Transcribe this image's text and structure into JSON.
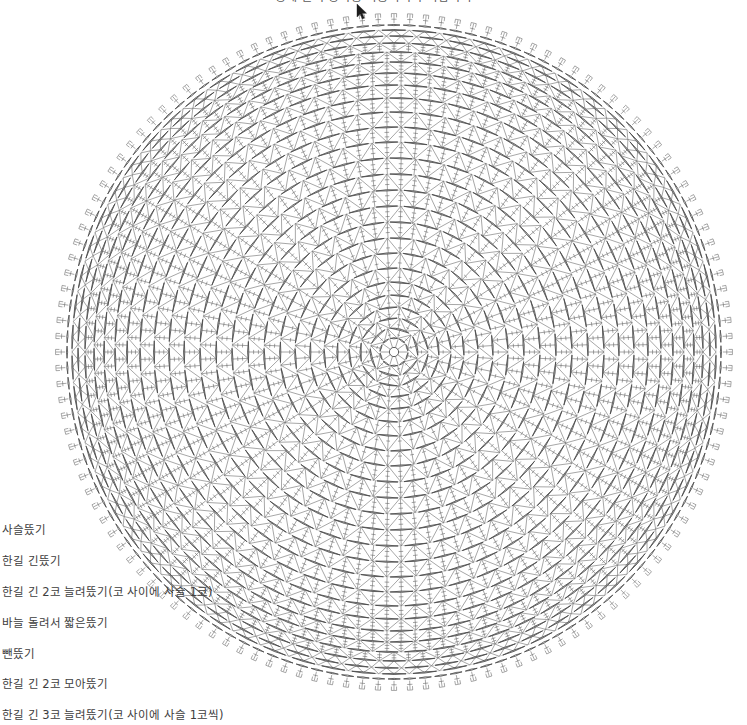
{
  "document": {
    "kind": "crochet-chart",
    "title_partial": "장에 길이 장식용 사용하시기 바랍니다",
    "background_color": "#ffffff",
    "ink_color": "#6b6b6b",
    "ink_color_dark": "#4a4a4a"
  },
  "chart": {
    "center_x": 394,
    "center_y": 352,
    "outer_radius": 330,
    "shape": "circle",
    "rounds_total": 27,
    "picot_count": 132,
    "rings": [
      {
        "index": 1,
        "radius": 14,
        "spokes": 10,
        "style": "magic-ring"
      },
      {
        "index": 2,
        "radius": 24,
        "spokes": 12,
        "style": "chain-arc-v"
      },
      {
        "index": 3,
        "radius": 34,
        "spokes": 18,
        "style": "chain-arc-v"
      },
      {
        "index": 4,
        "radius": 45,
        "spokes": 24,
        "style": "chain-arc-v"
      },
      {
        "index": 5,
        "radius": 57,
        "spokes": 30,
        "style": "chain-arc-v"
      },
      {
        "index": 6,
        "radius": 70,
        "spokes": 36,
        "style": "chain-arc-v"
      },
      {
        "index": 7,
        "radius": 84,
        "spokes": 42,
        "style": "chain-arc-v"
      },
      {
        "index": 8,
        "radius": 99,
        "spokes": 48,
        "style": "chain-arc-v"
      },
      {
        "index": 9,
        "radius": 114,
        "spokes": 54,
        "style": "chain-arc-v"
      },
      {
        "index": 10,
        "radius": 130,
        "spokes": 60,
        "style": "chain-arc-v"
      },
      {
        "index": 11,
        "radius": 146,
        "spokes": 66,
        "style": "chain-arc-v"
      },
      {
        "index": 12,
        "radius": 162,
        "spokes": 72,
        "style": "chain-arc-v"
      },
      {
        "index": 13,
        "radius": 178,
        "spokes": 78,
        "style": "chain-arc-v"
      },
      {
        "index": 14,
        "radius": 194,
        "spokes": 84,
        "style": "chain-arc-v"
      },
      {
        "index": 15,
        "radius": 210,
        "spokes": 90,
        "style": "chain-arc-v"
      },
      {
        "index": 16,
        "radius": 225,
        "spokes": 96,
        "style": "chain-arc-v"
      },
      {
        "index": 17,
        "radius": 240,
        "spokes": 102,
        "style": "chain-arc-v"
      },
      {
        "index": 18,
        "radius": 254,
        "spokes": 108,
        "style": "chain-arc-v"
      },
      {
        "index": 19,
        "radius": 267,
        "spokes": 114,
        "style": "chain-arc-v"
      },
      {
        "index": 20,
        "radius": 279,
        "spokes": 120,
        "style": "chain-arc-v"
      },
      {
        "index": 21,
        "radius": 290,
        "spokes": 126,
        "style": "chain-arc-v"
      },
      {
        "index": 22,
        "radius": 300,
        "spokes": 132,
        "style": "chain-arc-v"
      },
      {
        "index": 23,
        "radius": 309,
        "spokes": 132,
        "style": "chain-arc-v"
      },
      {
        "index": 24,
        "radius": 316,
        "spokes": 132,
        "style": "zigzag"
      },
      {
        "index": 25,
        "radius": 322,
        "spokes": 132,
        "style": "zigzag"
      },
      {
        "index": 26,
        "radius": 327,
        "spokes": 132,
        "style": "chain-edge"
      },
      {
        "index": 27,
        "radius": 334,
        "spokes": 132,
        "style": "picot-edge"
      }
    ]
  },
  "cursor": {
    "x": 356,
    "y": 4,
    "name": "pointer"
  },
  "legend": {
    "items": [
      {
        "symbol": "chain",
        "label": "사슬뜼기"
      },
      {
        "symbol": "double-treble",
        "label": "한길 긴뜼기"
      },
      {
        "symbol": "inc-2-ch1",
        "label": "한길 긴 2코 늘려뜼기(코 사이에 사슬 1코)"
      },
      {
        "symbol": "sc-around",
        "label": "바늘 돌려서 짧은뜼기"
      },
      {
        "symbol": "slip-stitch",
        "label": "뺀뜼기"
      },
      {
        "symbol": "dec-2tog",
        "label": "한길 긴 2코 모아뜼기"
      },
      {
        "symbol": "inc-3-ch1",
        "label": "한길 긴 3코 늘려뜼기(코 사이에 사슬 1코씩)"
      }
    ]
  }
}
